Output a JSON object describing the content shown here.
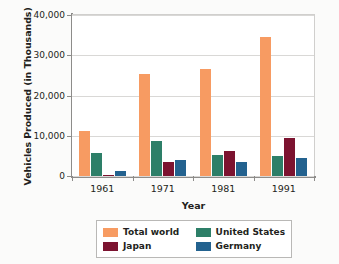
{
  "chart_data": {
    "type": "bar",
    "title": "",
    "xlabel": "Year",
    "ylabel": "Vehicles Produced (in Thousands)",
    "categories": [
      "1961",
      "1971",
      "1981",
      "1991"
    ],
    "series": [
      {
        "name": "Total world",
        "color": "#f79b62",
        "values": [
          11200,
          25300,
          26500,
          34500
        ]
      },
      {
        "name": "United States",
        "color": "#2d7f68",
        "values": [
          5800,
          8800,
          5300,
          4900
        ]
      },
      {
        "name": "Japan",
        "color": "#7c1330",
        "values": [
          250,
          3600,
          6200,
          9500
        ]
      },
      {
        "name": "Germany",
        "color": "#23628f",
        "values": [
          1300,
          3900,
          3600,
          4400
        ]
      }
    ],
    "ylim": [
      0,
      40000
    ],
    "yticks": [
      0,
      10000,
      20000,
      30000,
      40000
    ],
    "ytick_labels": [
      "0",
      "10,000",
      "20,000",
      "30,000",
      "40,000"
    ],
    "grid": true,
    "legend_position": "bottom-center"
  }
}
